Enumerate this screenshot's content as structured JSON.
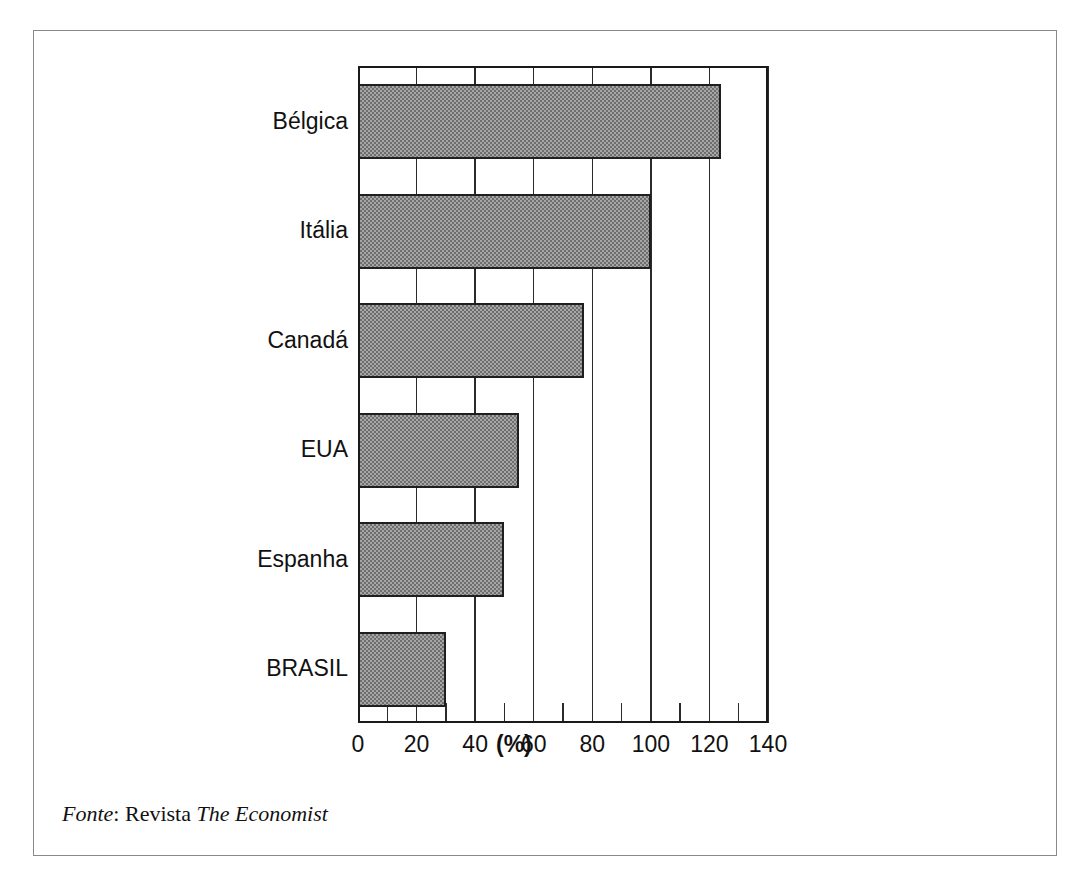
{
  "figure": {
    "source_note": {
      "label": "Fonte",
      "separator": ": ",
      "prefix": "Revista ",
      "publication": "The Economist"
    }
  },
  "chart_data": {
    "type": "bar",
    "orientation": "horizontal",
    "title": "",
    "subtitle": "",
    "xlabel": "(%)",
    "ylabel": "",
    "categories": [
      "Bélgica",
      "Itália",
      "Canadá",
      "EUA",
      "Espanha",
      "BRASIL"
    ],
    "values": [
      124,
      100,
      77,
      55,
      50,
      30
    ],
    "series": [
      {
        "name": "",
        "values": [
          124,
          100,
          77,
          55,
          50,
          30
        ]
      }
    ],
    "xlim": [
      0,
      140
    ],
    "ylim": [
      0,
      6
    ],
    "xticks": [
      0,
      20,
      40,
      60,
      80,
      100,
      120,
      140
    ],
    "xtick_labels": [
      "0",
      "20",
      "40",
      "60",
      "80",
      "100",
      "120",
      "140"
    ],
    "minor_xticks": [
      10,
      30,
      50,
      70,
      90,
      110,
      130
    ],
    "grid": "vertical",
    "legend": "none",
    "unit": "%",
    "bar_fill": "#a6a6a6",
    "bar_edge": "#1f1f1f",
    "axis_color": "#1a1a1a",
    "frame_color": "#8a8a8a",
    "annotations": []
  }
}
